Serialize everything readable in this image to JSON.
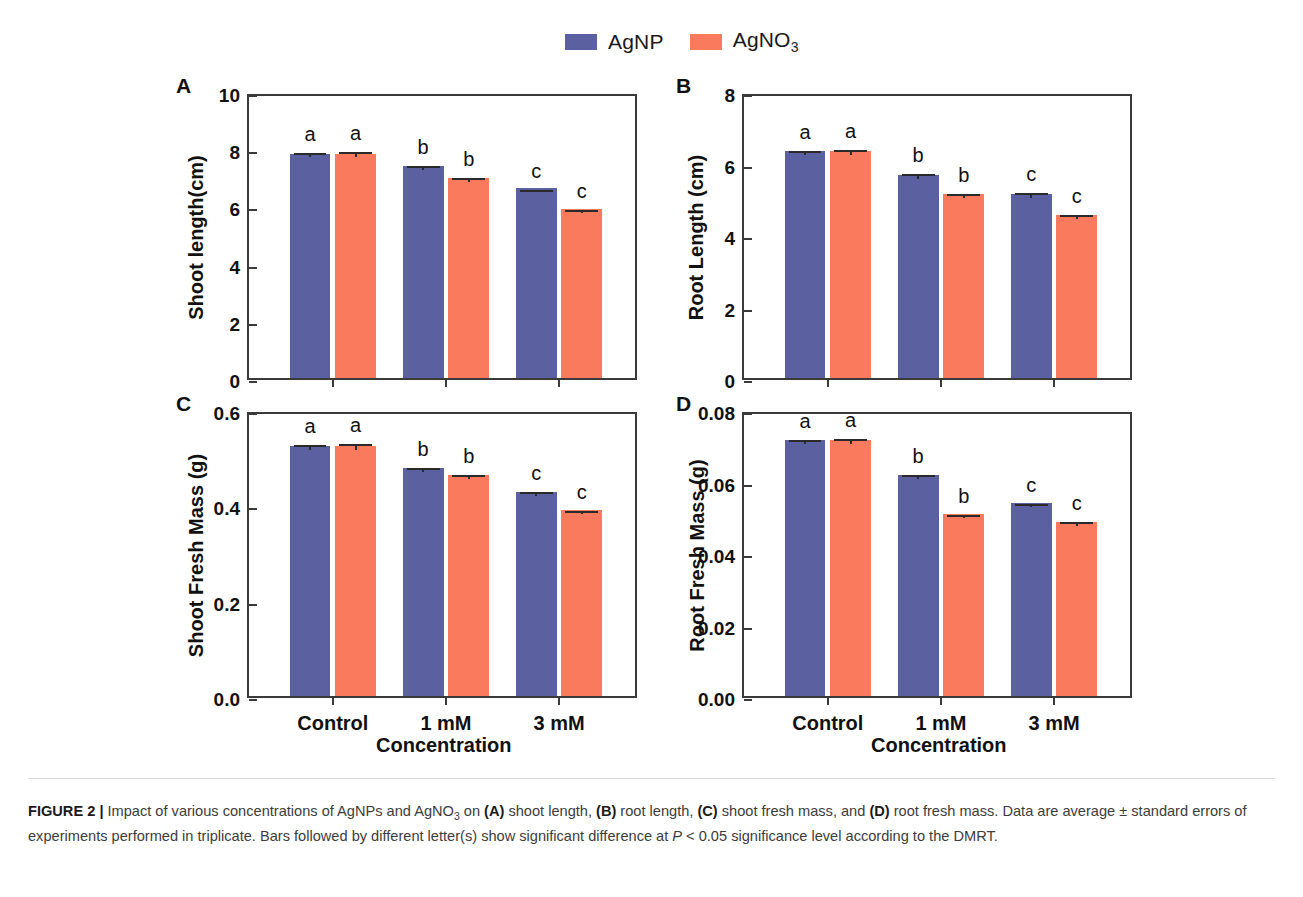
{
  "legend": {
    "entries": [
      {
        "label": "AgNP",
        "color": "#5b61a0",
        "name": "agnp"
      },
      {
        "label": "AgNO",
        "sub": "3",
        "color": "#fa7a5e",
        "name": "agno3"
      }
    ]
  },
  "xaxis_title": "Concentration",
  "categories": [
    "Control",
    "1 mM",
    "3 mM"
  ],
  "panels": [
    {
      "letter": "A",
      "ylabel": "Shoot length(cm)",
      "yticks": [
        "0",
        "2",
        "4",
        "6",
        "8",
        "10"
      ],
      "ymin": 0,
      "ymax": 10
    },
    {
      "letter": "B",
      "ylabel": "Root Length (cm)",
      "yticks": [
        "0",
        "2",
        "4",
        "6",
        "8"
      ],
      "ymin": 0,
      "ymax": 8
    },
    {
      "letter": "C",
      "ylabel": "Shoot Fresh Mass (g)",
      "yticks": [
        "0.0",
        "0.2",
        "0.4",
        "0.6"
      ],
      "ymin": 0,
      "ymax": 0.6
    },
    {
      "letter": "D",
      "ylabel": "Root Fresh Mass (g)",
      "yticks": [
        "0.00",
        "0.02",
        "0.04",
        "0.06",
        "0.08"
      ],
      "ymin": 0,
      "ymax": 0.08
    }
  ],
  "chart_data": [
    {
      "type": "bar",
      "panel": "A",
      "title": "",
      "xlabel": "Concentration",
      "ylabel": "Shoot length(cm)",
      "ylim": [
        0,
        10
      ],
      "yticks": [
        0,
        2,
        4,
        6,
        8,
        10
      ],
      "grid": false,
      "legend_position": "top",
      "categories": [
        "Control",
        "1 mM",
        "3 mM"
      ],
      "series": [
        {
          "name": "AgNP",
          "color": "#5b61a0",
          "values": [
            7.85,
            7.42,
            6.63
          ],
          "errors": [
            0.17,
            0.13,
            0.1
          ],
          "letters": [
            "a",
            "b",
            "c"
          ]
        },
        {
          "name": "AgNO3",
          "color": "#fa7a5e",
          "values": [
            7.85,
            7.0,
            5.9
          ],
          "errors": [
            0.2,
            0.14,
            0.11
          ],
          "letters": [
            "a",
            "b",
            "c"
          ]
        }
      ]
    },
    {
      "type": "bar",
      "panel": "B",
      "title": "",
      "xlabel": "Concentration",
      "ylabel": "Root Length (cm)",
      "ylim": [
        0,
        8
      ],
      "yticks": [
        0,
        2,
        4,
        6,
        8
      ],
      "grid": false,
      "legend_position": "top",
      "categories": [
        "Control",
        "1 mM",
        "3 mM"
      ],
      "series": [
        {
          "name": "AgNP",
          "color": "#5b61a0",
          "values": [
            6.35,
            5.68,
            5.15
          ],
          "errors": [
            0.12,
            0.13,
            0.13
          ],
          "letters": [
            "a",
            "b",
            "c"
          ]
        },
        {
          "name": "AgNO3",
          "color": "#fa7a5e",
          "values": [
            6.35,
            5.15,
            4.55
          ],
          "errors": [
            0.14,
            0.11,
            0.12
          ],
          "letters": [
            "a",
            "b",
            "c"
          ]
        }
      ]
    },
    {
      "type": "bar",
      "panel": "C",
      "title": "",
      "xlabel": "Concentration",
      "ylabel": "Shoot Fresh Mass (g)",
      "ylim": [
        0,
        0.6
      ],
      "yticks": [
        0.0,
        0.2,
        0.4,
        0.6
      ],
      "grid": false,
      "legend_position": "top",
      "categories": [
        "Control",
        "1 mM",
        "3 mM"
      ],
      "series": [
        {
          "name": "AgNP",
          "color": "#5b61a0",
          "values": [
            0.525,
            0.478,
            0.428
          ],
          "errors": [
            0.01,
            0.009,
            0.008
          ],
          "letters": [
            "a",
            "b",
            "c"
          ]
        },
        {
          "name": "AgNO3",
          "color": "#fa7a5e",
          "values": [
            0.525,
            0.463,
            0.39
          ],
          "errors": [
            0.012,
            0.008,
            0.006
          ],
          "letters": [
            "a",
            "b",
            "c"
          ]
        }
      ]
    },
    {
      "type": "bar",
      "panel": "D",
      "title": "",
      "xlabel": "Concentration",
      "ylabel": "Root Fresh Mass (g)",
      "ylim": [
        0,
        0.08
      ],
      "yticks": [
        0.0,
        0.02,
        0.04,
        0.06,
        0.08
      ],
      "grid": false,
      "legend_position": "top",
      "categories": [
        "Control",
        "1 mM",
        "3 mM"
      ],
      "series": [
        {
          "name": "AgNP",
          "color": "#5b61a0",
          "values": [
            0.0715,
            0.0618,
            0.054
          ],
          "errors": [
            0.0012,
            0.001,
            0.0009
          ],
          "letters": [
            "a",
            "b",
            "c"
          ]
        },
        {
          "name": "AgNO3",
          "color": "#fa7a5e",
          "values": [
            0.0715,
            0.0508,
            0.0487
          ],
          "errors": [
            0.0014,
            0.0009,
            0.001
          ],
          "letters": [
            "a",
            "b",
            "c"
          ]
        }
      ]
    }
  ],
  "caption": {
    "figure_label": "FIGURE 2",
    "separator": "|",
    "text_1": " Impact of various concentrations of AgNPs and AgNO",
    "sub_1": "3",
    "text_2": " on ",
    "bold_a": "(A)",
    "text_3": " shoot length, ",
    "bold_b": "(B)",
    "text_4": " root length, ",
    "bold_c": "(C)",
    "text_5": " shoot fresh mass, and ",
    "bold_d": "(D)",
    "text_6": " root fresh mass. Data are average ± standard errors of experiments performed in triplicate. Bars followed by different letter(s) show significant difference at ",
    "italic_p": "P",
    "text_7": " < 0.05 significance level according to the DMRT."
  }
}
